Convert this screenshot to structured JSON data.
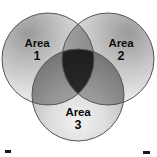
{
  "diagram": {
    "type": "venn-3-circle",
    "canvas": {
      "width": 157,
      "height": 157
    },
    "background_color": "#ffffff",
    "outline_color": "#555555",
    "text_color": "#0a0a0a",
    "fill_light": "#e8e8e8",
    "fill_mid": "#b8b8b8",
    "fill_dark": "#8a8a8a",
    "circles": [
      {
        "id": "circle-1",
        "label_word": "Area",
        "label_number": "1",
        "cx": 48,
        "cy": 59,
        "r": 46,
        "position": "top-left"
      },
      {
        "id": "circle-2",
        "label_word": "Area",
        "label_number": "2",
        "cx": 108,
        "cy": 59,
        "r": 46,
        "position": "top-right"
      },
      {
        "id": "circle-3",
        "label_word": "Area",
        "label_number": "3",
        "cx": 78,
        "cy": 95,
        "r": 46,
        "position": "bottom-center"
      }
    ],
    "labels": [
      {
        "id": "label-area-1",
        "word": "Area",
        "number": "1"
      },
      {
        "id": "label-area-2",
        "word": "Area",
        "number": "2"
      },
      {
        "id": "label-area-3",
        "word": "Area",
        "number": "3"
      }
    ]
  }
}
